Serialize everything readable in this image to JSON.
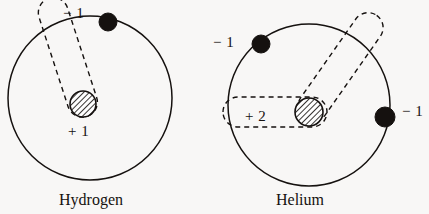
{
  "figure": {
    "background_color": "#f8f7f6",
    "ink_color": "#15110f",
    "type": "bohr-atom-diagram",
    "atoms": [
      {
        "name": "hydrogen",
        "caption": "Hydrogen",
        "nucleus_charge": "+ 1",
        "electron_charges": [
          "− 1"
        ],
        "electron_count": 1,
        "shell_circle": {
          "cx": 90,
          "cy": 98,
          "r": 82
        },
        "nucleus": {
          "cx": 83,
          "cy": 104,
          "r": 13,
          "fill": "diagonal-hatch"
        },
        "electrons": [
          {
            "cx": 108,
            "cy": 22,
            "r": 9
          }
        ]
      },
      {
        "name": "helium",
        "caption": "Helium",
        "nucleus_charge": "+ 2",
        "electron_charges": [
          "− 1",
          "− 1"
        ],
        "electron_count": 2,
        "shell_circle": {
          "cx": 309,
          "cy": 105,
          "r": 81
        },
        "nucleus": {
          "cx": 309,
          "cy": 112,
          "r": 14,
          "fill": "diagonal-hatch"
        },
        "electrons": [
          {
            "cx": 261,
            "cy": 44,
            "r": 9
          },
          {
            "cx": 385,
            "cy": 117,
            "r": 10
          }
        ]
      }
    ]
  },
  "hydrogen_labels": {
    "electron_charge": "− 1",
    "nucleus_charge": "+ 1",
    "caption": "Hydrogen"
  },
  "helium_labels": {
    "electron1_charge": "− 1",
    "electron2_charge": "− 1",
    "nucleus_charge": "+ 2",
    "caption": "Helium"
  }
}
